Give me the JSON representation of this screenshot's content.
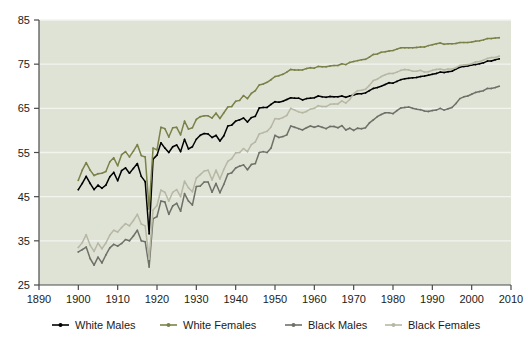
{
  "chart_data": {
    "type": "line",
    "title": "",
    "subtitle": "",
    "xlabel": "",
    "ylabel": "",
    "xlim": [
      1890,
      2010
    ],
    "ylim": [
      25,
      85
    ],
    "xticks": [
      1890,
      1900,
      1910,
      1920,
      1930,
      1940,
      1950,
      1960,
      1970,
      1980,
      1990,
      2000,
      2010
    ],
    "yticks": [
      25,
      35,
      45,
      55,
      65,
      75,
      85
    ],
    "grid": true,
    "grid_axis": "y",
    "grid_color": "#f2f4ee",
    "plot_background": "#dfe3d6",
    "page_background": "#ffffff",
    "legend_position": "bottom",
    "series": [
      {
        "name": "White Males",
        "color": "#000000",
        "marker": "dot",
        "x": [
          1900,
          1901,
          1902,
          1903,
          1904,
          1905,
          1906,
          1907,
          1908,
          1909,
          1910,
          1911,
          1912,
          1913,
          1914,
          1915,
          1916,
          1917,
          1918,
          1919,
          1920,
          1921,
          1922,
          1923,
          1924,
          1925,
          1926,
          1927,
          1928,
          1929,
          1930,
          1931,
          1932,
          1933,
          1934,
          1935,
          1936,
          1937,
          1938,
          1939,
          1940,
          1941,
          1942,
          1943,
          1944,
          1945,
          1946,
          1947,
          1948,
          1949,
          1950,
          1951,
          1952,
          1953,
          1954,
          1955,
          1956,
          1957,
          1958,
          1959,
          1960,
          1961,
          1962,
          1963,
          1964,
          1965,
          1966,
          1967,
          1968,
          1969,
          1970,
          1971,
          1972,
          1973,
          1974,
          1975,
          1976,
          1977,
          1978,
          1979,
          1980,
          1981,
          1982,
          1983,
          1984,
          1985,
          1986,
          1987,
          1988,
          1989,
          1990,
          1991,
          1992,
          1993,
          1994,
          1995,
          1996,
          1997,
          1998,
          1999,
          2000,
          2001,
          2002,
          2003,
          2004,
          2005,
          2006,
          2007
        ],
        "y": [
          46.6,
          48.0,
          49.6,
          48.0,
          46.6,
          47.6,
          46.9,
          47.6,
          49.5,
          50.5,
          48.6,
          50.9,
          51.5,
          50.3,
          51.4,
          52.5,
          49.6,
          48.4,
          36.6,
          53.5,
          54.4,
          57.2,
          56.0,
          55.0,
          56.3,
          56.7,
          55.2,
          58.0,
          55.8,
          56.3,
          58.0,
          58.9,
          59.3,
          59.2,
          58.4,
          58.9,
          57.6,
          58.8,
          61.0,
          61.2,
          62.1,
          62.4,
          62.8,
          61.9,
          62.9,
          63.2,
          65.1,
          65.2,
          65.2,
          65.9,
          66.5,
          66.4,
          66.6,
          67.0,
          67.4,
          67.3,
          67.3,
          66.9,
          67.2,
          67.3,
          67.4,
          67.8,
          67.6,
          67.5,
          67.7,
          67.6,
          67.6,
          67.8,
          67.5,
          67.8,
          68.0,
          68.3,
          68.3,
          68.5,
          69.0,
          69.5,
          69.7,
          70.0,
          70.4,
          70.8,
          70.7,
          71.1,
          71.5,
          71.7,
          71.8,
          71.9,
          72.0,
          72.2,
          72.3,
          72.5,
          72.7,
          72.9,
          73.2,
          73.1,
          73.3,
          73.4,
          73.9,
          74.3,
          74.5,
          74.6,
          74.8,
          74.9,
          75.1,
          75.3,
          75.7,
          75.7,
          76.0,
          76.2
        ]
      },
      {
        "name": "White Females",
        "color": "#7b8148",
        "marker": "dot",
        "x": [
          1900,
          1901,
          1902,
          1903,
          1904,
          1905,
          1906,
          1907,
          1908,
          1909,
          1910,
          1911,
          1912,
          1913,
          1914,
          1915,
          1916,
          1917,
          1918,
          1919,
          1920,
          1921,
          1922,
          1923,
          1924,
          1925,
          1926,
          1927,
          1928,
          1929,
          1930,
          1931,
          1932,
          1933,
          1934,
          1935,
          1936,
          1937,
          1938,
          1939,
          1940,
          1941,
          1942,
          1943,
          1944,
          1945,
          1946,
          1947,
          1948,
          1949,
          1950,
          1951,
          1952,
          1953,
          1954,
          1955,
          1956,
          1957,
          1958,
          1959,
          1960,
          1961,
          1962,
          1963,
          1964,
          1965,
          1966,
          1967,
          1968,
          1969,
          1970,
          1971,
          1972,
          1973,
          1974,
          1975,
          1976,
          1977,
          1978,
          1979,
          1980,
          1981,
          1982,
          1983,
          1984,
          1985,
          1986,
          1987,
          1988,
          1989,
          1990,
          1991,
          1992,
          1993,
          1994,
          1995,
          1996,
          1997,
          1998,
          1999,
          2000,
          2001,
          2002,
          2003,
          2004,
          2005,
          2006,
          2007
        ],
        "y": [
          48.7,
          51.0,
          52.7,
          51.0,
          49.8,
          50.2,
          50.3,
          50.7,
          52.9,
          53.8,
          52.0,
          54.5,
          55.2,
          54.0,
          55.3,
          56.8,
          54.3,
          54.0,
          42.2,
          56.0,
          55.6,
          60.7,
          60.4,
          58.5,
          60.6,
          60.7,
          59.0,
          62.1,
          60.3,
          60.6,
          62.5,
          63.1,
          63.3,
          63.3,
          62.8,
          63.9,
          62.7,
          64.0,
          65.3,
          65.4,
          66.6,
          66.8,
          67.9,
          67.2,
          68.4,
          69.0,
          70.3,
          70.5,
          70.9,
          71.5,
          72.2,
          72.4,
          72.7,
          73.2,
          73.8,
          73.7,
          73.7,
          73.7,
          74.0,
          74.2,
          74.1,
          74.5,
          74.4,
          74.4,
          74.6,
          74.7,
          74.7,
          75.1,
          74.9,
          75.4,
          75.6,
          75.8,
          76.0,
          76.1,
          76.6,
          77.2,
          77.3,
          77.7,
          77.8,
          78.0,
          78.1,
          78.4,
          78.7,
          78.7,
          78.7,
          78.7,
          78.8,
          78.9,
          78.9,
          79.2,
          79.4,
          79.6,
          79.8,
          79.5,
          79.6,
          79.6,
          79.7,
          79.9,
          79.9,
          79.9,
          80.0,
          80.2,
          80.3,
          80.5,
          80.8,
          80.8,
          80.9,
          81.0
        ]
      },
      {
        "name": "Black Males",
        "color": "#6e7168",
        "marker": "dot",
        "x": [
          1900,
          1901,
          1902,
          1903,
          1904,
          1905,
          1906,
          1907,
          1908,
          1909,
          1910,
          1911,
          1912,
          1913,
          1914,
          1915,
          1916,
          1917,
          1918,
          1919,
          1920,
          1921,
          1922,
          1923,
          1924,
          1925,
          1926,
          1927,
          1928,
          1929,
          1930,
          1931,
          1932,
          1933,
          1934,
          1935,
          1936,
          1937,
          1938,
          1939,
          1940,
          1941,
          1942,
          1943,
          1944,
          1945,
          1946,
          1947,
          1948,
          1949,
          1950,
          1951,
          1952,
          1953,
          1954,
          1955,
          1956,
          1957,
          1958,
          1959,
          1960,
          1961,
          1962,
          1963,
          1964,
          1965,
          1966,
          1967,
          1968,
          1969,
          1970,
          1971,
          1972,
          1973,
          1974,
          1975,
          1976,
          1977,
          1978,
          1979,
          1980,
          1981,
          1982,
          1983,
          1984,
          1985,
          1986,
          1987,
          1988,
          1989,
          1990,
          1991,
          1992,
          1993,
          1994,
          1995,
          1996,
          1997,
          1998,
          1999,
          2000,
          2001,
          2002,
          2003,
          2004,
          2005,
          2006,
          2007
        ],
        "y": [
          32.5,
          33.0,
          33.6,
          31.0,
          29.5,
          31.3,
          30.0,
          31.8,
          33.4,
          34.2,
          33.8,
          34.4,
          35.3,
          35.0,
          36.1,
          37.4,
          35.0,
          34.8,
          29.1,
          40.0,
          40.5,
          44.0,
          43.8,
          41.0,
          42.9,
          43.5,
          41.7,
          45.7,
          44.0,
          43.1,
          47.3,
          47.4,
          48.3,
          48.3,
          46.0,
          48.0,
          45.9,
          47.8,
          50.1,
          50.4,
          51.5,
          51.9,
          52.2,
          51.1,
          52.3,
          52.5,
          55.0,
          55.2,
          55.0,
          56.0,
          58.9,
          58.4,
          58.6,
          59.0,
          61.0,
          60.7,
          60.4,
          60.1,
          60.6,
          61.0,
          60.7,
          61.0,
          60.7,
          60.4,
          60.9,
          60.9,
          60.6,
          61.1,
          60.1,
          60.5,
          60.0,
          60.5,
          60.4,
          60.6,
          61.7,
          62.4,
          63.1,
          63.6,
          64.0,
          64.0,
          63.8,
          64.5,
          65.1,
          65.2,
          65.3,
          65.0,
          64.8,
          64.7,
          64.4,
          64.3,
          64.5,
          64.6,
          65.0,
          64.6,
          64.9,
          65.2,
          66.1,
          67.2,
          67.6,
          67.8,
          68.2,
          68.6,
          68.8,
          69.0,
          69.5,
          69.5,
          69.7,
          70.0
        ]
      },
      {
        "name": "Black Females",
        "color": "#b7b8a4",
        "marker": "dot",
        "x": [
          1900,
          1901,
          1902,
          1903,
          1904,
          1905,
          1906,
          1907,
          1908,
          1909,
          1910,
          1911,
          1912,
          1913,
          1914,
          1915,
          1916,
          1917,
          1918,
          1919,
          1920,
          1921,
          1922,
          1923,
          1924,
          1925,
          1926,
          1927,
          1928,
          1929,
          1930,
          1931,
          1932,
          1933,
          1934,
          1935,
          1936,
          1937,
          1938,
          1939,
          1940,
          1941,
          1942,
          1943,
          1944,
          1945,
          1946,
          1947,
          1948,
          1949,
          1950,
          1951,
          1952,
          1953,
          1954,
          1955,
          1956,
          1957,
          1958,
          1959,
          1960,
          1961,
          1962,
          1963,
          1964,
          1965,
          1966,
          1967,
          1968,
          1969,
          1970,
          1971,
          1972,
          1973,
          1974,
          1975,
          1976,
          1977,
          1978,
          1979,
          1980,
          1981,
          1982,
          1983,
          1984,
          1985,
          1986,
          1987,
          1988,
          1989,
          1990,
          1991,
          1992,
          1993,
          1994,
          1995,
          1996,
          1997,
          1998,
          1999,
          2000,
          2001,
          2002,
          2003,
          2004,
          2005,
          2006,
          2007
        ],
        "y": [
          33.5,
          34.6,
          36.4,
          34.0,
          32.6,
          34.5,
          33.2,
          34.5,
          36.3,
          37.4,
          37.0,
          38.0,
          38.9,
          38.4,
          39.6,
          41.0,
          38.8,
          38.4,
          30.9,
          42.0,
          43.0,
          46.5,
          46.0,
          44.0,
          46.0,
          46.6,
          45.0,
          48.5,
          47.0,
          46.1,
          49.2,
          50.0,
          50.8,
          51.0,
          48.8,
          51.0,
          49.0,
          51.2,
          53.0,
          53.6,
          54.9,
          55.0,
          55.9,
          55.2,
          56.8,
          57.4,
          59.2,
          59.5,
          59.8,
          60.8,
          62.7,
          62.6,
          62.9,
          63.4,
          65.0,
          64.6,
          64.2,
          64.0,
          64.3,
          64.8,
          65.0,
          65.6,
          65.4,
          65.4,
          65.9,
          66.0,
          66.0,
          66.7,
          66.2,
          67.0,
          68.3,
          69.0,
          69.1,
          69.3,
          70.2,
          71.3,
          71.6,
          72.2,
          72.6,
          72.9,
          72.9,
          73.2,
          73.6,
          73.8,
          73.7,
          73.4,
          73.4,
          73.6,
          73.2,
          73.3,
          73.6,
          73.8,
          73.9,
          73.7,
          73.9,
          73.9,
          74.2,
          74.7,
          74.8,
          74.9,
          75.1,
          75.5,
          75.6,
          75.9,
          76.3,
          76.5,
          76.5,
          76.8
        ]
      }
    ]
  },
  "legend": {
    "items": [
      {
        "label": "White Males",
        "color": "#000000"
      },
      {
        "label": "White Females",
        "color": "#7b8148"
      },
      {
        "label": "Black Males",
        "color": "#6e7168"
      },
      {
        "label": "Black Females",
        "color": "#b7b8a4"
      }
    ]
  }
}
